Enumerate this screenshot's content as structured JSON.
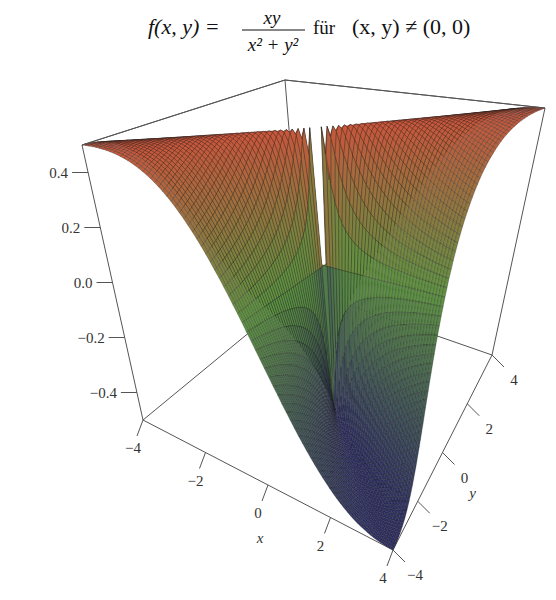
{
  "chart_data": {
    "type": "surface3d",
    "title": {
      "lhs": "f(x, y) =",
      "numerator": "xy",
      "denominator": "x² + y²",
      "condition_word": "für",
      "condition": "(x, y) ≠ (0, 0)",
      "full_text": "f(x, y) = xy / (x² + y²) für (x, y) ≠ (0, 0)"
    },
    "function": "x*y/(x^2+y^2)",
    "xlabel": "x",
    "ylabel": "y",
    "zlabel": "",
    "xlim": [
      -4,
      4
    ],
    "ylim": [
      -4,
      4
    ],
    "zlim": [
      -0.5,
      0.5
    ],
    "x_ticks": [
      -4,
      -2,
      0,
      2,
      4
    ],
    "x_tick_labels": [
      "−4",
      "−2",
      "0",
      "2",
      "4"
    ],
    "y_ticks": [
      -4,
      -2,
      0,
      2,
      4
    ],
    "y_tick_labels": [
      "−4",
      "−2",
      "0",
      "2",
      "4"
    ],
    "z_ticks": [
      0.4,
      0.2,
      0.0,
      -0.2,
      -0.4
    ],
    "z_tick_labels": [
      "0.4",
      "0.2",
      "0.0",
      "−0.2",
      "−0.4"
    ],
    "grid_resolution": 80,
    "colormap": {
      "high": "#c9563c",
      "mid": "#5e9442",
      "low": "#2f2f66"
    },
    "mesh_line_color": "#1a1a1a",
    "box_color": "#555555"
  }
}
